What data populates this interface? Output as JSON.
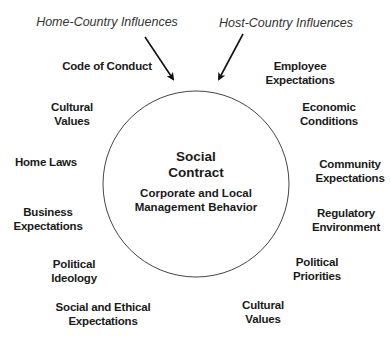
{
  "headers": {
    "home": "Home-Country Influences",
    "host": "Host-Country Influences"
  },
  "center": {
    "title": [
      "Social",
      "Contract"
    ],
    "subtitle": [
      "Corporate and Local",
      "Management Behavior"
    ]
  },
  "home_influences": [
    {
      "lines": [
        "Code of Conduct"
      ]
    },
    {
      "lines": [
        "Cultural",
        "Values"
      ]
    },
    {
      "lines": [
        "Home Laws"
      ]
    },
    {
      "lines": [
        "Business",
        "Expectations"
      ]
    },
    {
      "lines": [
        "Political",
        "Ideology"
      ]
    },
    {
      "lines": [
        "Social and Ethical",
        "Expectations"
      ]
    }
  ],
  "host_influences": [
    {
      "lines": [
        "Employee",
        "Expectations"
      ]
    },
    {
      "lines": [
        "Economic",
        "Conditions"
      ]
    },
    {
      "lines": [
        "Community",
        "Expectations"
      ]
    },
    {
      "lines": [
        "Regulatory",
        "Environment"
      ]
    },
    {
      "lines": [
        "Political",
        "Priorities"
      ]
    },
    {
      "lines": [
        "Cultural",
        "Values"
      ]
    }
  ],
  "colors": {
    "stroke": "#333333",
    "text": "#1a1a1a"
  }
}
